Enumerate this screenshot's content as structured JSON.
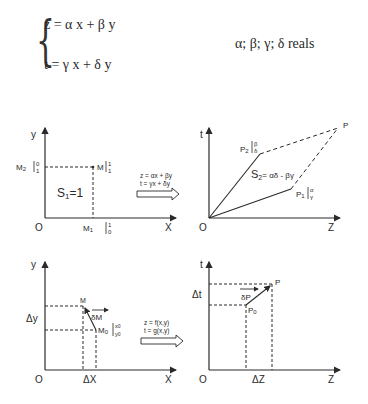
{
  "equations": {
    "line1": "z = α x + β y",
    "line2": "t = γ x + δ y",
    "note": "α; β; γ; δ reals"
  },
  "top_left": {
    "y_axis": "y",
    "x_axis": "X",
    "origin": "O",
    "M2_label": "M",
    "M2_sub": "2",
    "M2_coord_top": "0",
    "M2_coord_bottom": "1",
    "M_label": "M",
    "M_coord_top": "1",
    "M_coord_bottom": "1",
    "M1_label": "M",
    "M1_sub": "1",
    "M1_coord_top": "1",
    "M1_coord_bottom": "0",
    "area": "S",
    "area_sub": "1",
    "area_value": "=1"
  },
  "transform_top": {
    "line1": "z = αx + βy",
    "line2": "t = γx + δy"
  },
  "top_right": {
    "y_axis": "t",
    "x_axis": "Z",
    "origin": "O",
    "P2_label": "P",
    "P2_sub": "2",
    "P2_coord_top": "β",
    "P2_coord_bottom": "δ",
    "P1_label": "P",
    "P1_sub": "1",
    "P1_coord_top": "α",
    "P1_coord_bottom": "γ",
    "P_label": "P",
    "area": "S",
    "area_sub": "2",
    "area_value": "= αδ - βγ"
  },
  "bottom_left": {
    "y_axis": "y",
    "x_axis": "X",
    "origin": "O",
    "delta_y": "Δy",
    "delta_x": "ΔX",
    "M_label": "M",
    "M0_label": "M",
    "M0_sub": "0",
    "M0_coord_top": "x",
    "M0_coord_top_sub": "0",
    "M0_coord_bottom": "y",
    "M0_coord_bottom_sub": "0",
    "vector": "δM"
  },
  "transform_bottom": {
    "line1": "z = f(x,y)",
    "line2": "t = g(x,y)"
  },
  "bottom_right": {
    "y_axis": "t",
    "x_axis": "Z",
    "origin": "O",
    "delta_t": "Δt",
    "delta_z": "ΔZ",
    "P_label": "P",
    "P0_label": "P",
    "P0_sub": "0",
    "vector": "δP"
  },
  "colors": {
    "ink": "#2a2a2a",
    "background": "#ffffff"
  }
}
